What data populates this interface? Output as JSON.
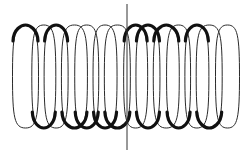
{
  "diagram": {
    "type": "coil-helix-side-view",
    "colors": {
      "background": "#ffffff",
      "wire": "#2a2a2a",
      "wire_front": "#111111",
      "axis_line": "#333333"
    },
    "coil": {
      "loop_count": 14,
      "top_y": 25,
      "bottom_y": 128,
      "left_x": 15,
      "right_x": 238
    },
    "axis_line": {
      "x": 127,
      "y1": 4,
      "y2": 150
    }
  }
}
